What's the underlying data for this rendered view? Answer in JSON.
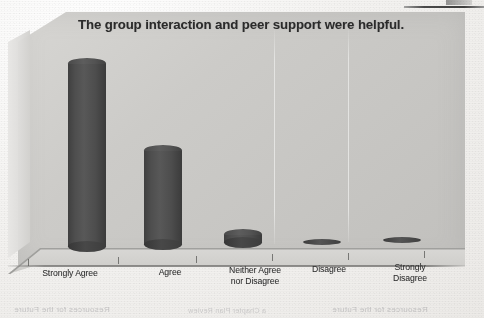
{
  "page": {
    "top_rule": "",
    "ghost_showthrough": {
      "block_lines": [
        "• Clear and concise material",
        "• Helpful handouts provided",
        "• Good pace and structure",
        "• Useful group discussion",
        "• Practical session content",
        "• Supportive facilitators",
        "• Would recommend"
      ],
      "bottom_left": "Resources for the Future",
      "bottom_middle": "a Chapter Plan Review",
      "bottom_right": "Resources for the Future"
    }
  },
  "chart_data": {
    "type": "bar",
    "subtype": "3d-cylinder",
    "title": "The group interaction and peer support were helpful.",
    "xlabel": "",
    "ylabel": "",
    "grid": true,
    "legend": false,
    "legend_position": "none",
    "ylim": [
      0,
      100
    ],
    "categories": [
      "Strongly Agree",
      "Agree",
      "Neither Agree nor Disagree",
      "Disagree",
      "Strongly Disagree"
    ],
    "values": [
      96,
      52,
      9,
      1,
      1
    ],
    "colors": {
      "bar_fill": "#4e4e4e",
      "bar_cap": "#585858",
      "wall": "#c9c8c5",
      "floor": "#d4d3d0",
      "title_text": "#2b2b2b",
      "label_text": "#2f2f2f",
      "paper": "#f2f1ef"
    }
  },
  "axis": {
    "category_labels": [
      {
        "line1": "Strongly Agree",
        "line2": ""
      },
      {
        "line1": "Agree",
        "line2": ""
      },
      {
        "line1": "Neither Agree",
        "line2": "nor Disagree"
      },
      {
        "line1": "Disagree",
        "line2": ""
      },
      {
        "line1": "Strongly",
        "line2": "Disagree"
      }
    ]
  }
}
